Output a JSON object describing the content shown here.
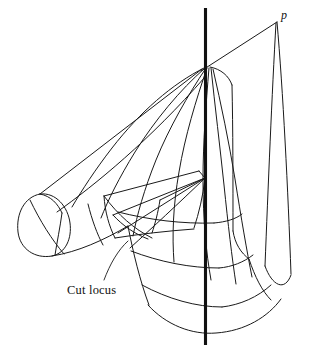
{
  "figure": {
    "background_color": "#ffffff",
    "stroke_color": "#1a1a1a",
    "axis_color": "#111111",
    "width": 310,
    "height": 358,
    "labels": {
      "cut_locus": "Cut locus",
      "point_p": "p"
    },
    "geometry": {
      "axis": {
        "name": "rotation-axis",
        "d": "M 205.5 8 L 205.5 345"
      },
      "strokes": [
        {
          "name": "upper-right-ridge",
          "d": "M 201 71 L 277 22"
        },
        {
          "name": "p-to-right-band-outer",
          "d": "M 277 22 C 283 90 288 190 291 274"
        },
        {
          "name": "p-to-right-band-inner",
          "d": "M 276 23 C 272 92 268 190 265 266"
        },
        {
          "name": "right-band-bottom-cap",
          "d": "M 265 266 C 272 286 285 292 291 275"
        },
        {
          "name": "apex-right-edge",
          "d": "M 210 67 C 221 69 229 76 232 85"
        },
        {
          "name": "right-panel-edge",
          "d": "M 232 85 C 233 130 233 180 233 231"
        },
        {
          "name": "right-panel-lower",
          "d": "M 233 231 C 235 244 241 253 249 259"
        },
        {
          "name": "left-long-upper-edge",
          "d": "M 202 69 L 40 194"
        },
        {
          "name": "left-long-lower-edge",
          "d": "M 205 77 C 150 140 95 185 57 212"
        },
        {
          "name": "left-cap-ellipse",
          "d": "M 40 194 C 24 197 16 214 18 232 C 20 249 35 259 52 256 C 66 253 72 238 70 223 C 68 207 56 192 40 194 Z"
        },
        {
          "name": "left-cap-inner-arc",
          "d": "M 40 194 C 51 196 58 204 62 213"
        },
        {
          "name": "left-lobe-bottom",
          "d": "M 52 256 C 78 252 104 240 128 226"
        },
        {
          "name": "left-lobe-rule-1",
          "d": "M 30 200 C 40 221 52 240 64 254"
        },
        {
          "name": "left-lobe-rule-2",
          "d": "M 62 213 C 60 228 57 242 55 255"
        },
        {
          "name": "left-lobe-rule-3",
          "d": "M 88 204 C 92 220 97 234 103 245"
        },
        {
          "name": "fan-curve-1",
          "d": "M 204 68 C 172 84 140 112 112 148 C 95 170 82 190 72 207"
        },
        {
          "name": "fan-curve-2",
          "d": "M 205 68 C 180 90 155 120 135 152 C 119 178 108 200 101 218"
        },
        {
          "name": "fan-curve-3",
          "d": "M 206 68 C 188 95 169 128 156 160 C 144 190 137 215 133 236"
        },
        {
          "name": "fan-curve-4",
          "d": "M 207 68 C 196 100 185 136 179 172 C 173 206 172 236 174 262"
        },
        {
          "name": "fan-curve-5",
          "d": "M 209 68 C 206 104 203 143 203 180 C 203 219 206 252 211 280"
        },
        {
          "name": "fan-curve-6",
          "d": "M 211 68 C 215 106 220 147 224 185 C 228 224 232 258 236 284"
        },
        {
          "name": "fan-curve-7",
          "d": "M 213 69 C 221 104 229 142 235 179 C 241 217 247 252 252 277"
        },
        {
          "name": "lower-left-surface-edge",
          "d": "M 128 226 C 133 252 140 281 149 305"
        },
        {
          "name": "bottom-boundary-arc",
          "d": "M 148 305 C 166 325 192 335 216 333 C 245 331 268 317 281 299"
        },
        {
          "name": "bottom-right-inner-arc",
          "d": "M 249 259 C 255 277 262 291 271 300"
        },
        {
          "name": "latitude-curve-1",
          "d": "M 118 212 C 150 220 182 224 214 223"
        },
        {
          "name": "latitude-curve-2",
          "d": "M 131 251 C 160 262 190 268 219 268"
        },
        {
          "name": "latitude-curve-3",
          "d": "M 142 285 C 168 299 196 307 222 307"
        },
        {
          "name": "latitude-curve-4",
          "d": "M 214 223 C 226 222 236 219 242 214"
        },
        {
          "name": "latitude-curve-5",
          "d": "M 219 268 C 232 267 244 262 253 255"
        },
        {
          "name": "latitude-curve-6",
          "d": "M 222 307 C 240 305 258 297 271 285"
        },
        {
          "name": "flap-outer-left-edge",
          "d": "M 104 196 L 199 171"
        },
        {
          "name": "flap-top-edge",
          "d": "M 199 171 L 205 178"
        },
        {
          "name": "flap-left-vertical",
          "d": "M 104 196 C 105 212 109 226 115 238"
        },
        {
          "name": "flap-right-edge",
          "d": "M 205 178 C 203 196 199 213 194 228"
        },
        {
          "name": "flap-bottom-arc",
          "d": "M 115 238 C 140 234 167 231 194 229"
        },
        {
          "name": "flap-crease-1",
          "d": "M 205 178 L 113 215"
        },
        {
          "name": "flap-crease-2",
          "d": "M 205 178 L 118 233"
        },
        {
          "name": "flap-crease-3",
          "d": "M 205 178 L 160 200"
        },
        {
          "name": "flap-crease-4",
          "d": "M 160 200 C 158 213 155 224 152 233"
        },
        {
          "name": "flap-crease-5",
          "d": "M 113 215 C 123 226 135 234 148 239"
        },
        {
          "name": "flap-crease-6",
          "d": "M 104 196 C 118 215 134 229 152 238"
        },
        {
          "name": "cut-locus-vertex-line",
          "d": "M 205 178 C 178 204 152 228 130 248"
        }
      ],
      "leader": {
        "name": "cut-locus-leader",
        "d": "M 104 280 C 110 264 118 250 128 241"
      }
    }
  }
}
